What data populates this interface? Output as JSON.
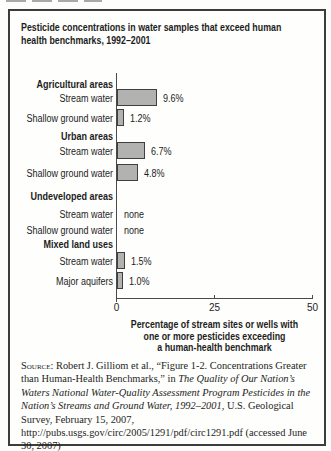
{
  "figure": {
    "title_lines": [
      "Pesticide concentrations in water samples that exceed human",
      "health benchmarks, 1992–2001"
    ]
  },
  "chart_data": {
    "type": "bar",
    "orientation": "horizontal",
    "title": "Pesticide concentrations in water samples that exceed human health benchmarks, 1992–2001",
    "xlabel": "Percentage of stream sites or wells with one or more pesticides exceeding a human-health benchmark",
    "xlabel_lines": [
      "Percentage of stream sites or wells with",
      "one or more pesticides exceeding",
      "a human-health benchmark"
    ],
    "xlim": [
      0,
      50
    ],
    "xticks": [
      "0",
      "25",
      "50"
    ],
    "grid": false,
    "bar_color": "#b2b2b0",
    "bar_border_color": "#3f3f3f",
    "groups": [
      {
        "header": "Agricultural areas",
        "items": [
          {
            "label": "Stream water",
            "value": 9.6,
            "display": "9.6%"
          },
          {
            "label": "Shallow ground water",
            "value": 1.2,
            "display": "1.2%"
          }
        ]
      },
      {
        "header": "Urban areas",
        "items": [
          {
            "label": "Stream water",
            "value": 6.7,
            "display": "6.7%"
          },
          {
            "label": "Shallow ground water",
            "value": 4.8,
            "display": "4.8%"
          }
        ]
      },
      {
        "header": "Undeveloped areas",
        "items": [
          {
            "label": "Stream water",
            "value": null,
            "display": "none"
          },
          {
            "label": "Shallow ground water",
            "value": null,
            "display": "none"
          }
        ]
      },
      {
        "header": "Mixed land uses",
        "items": [
          {
            "label": "Stream water",
            "value": 1.5,
            "display": "1.5%"
          },
          {
            "label": "Major aquifers",
            "value": 1.0,
            "display": "1.0%"
          }
        ]
      }
    ]
  },
  "source": {
    "segments": [
      {
        "text": "Source:",
        "style": "smallcaps"
      },
      {
        "text": " Robert J. Gilliom et al., “Figure 1-2. Concentrations Greater than Human-Health Benchmarks,” in ",
        "style": "normal"
      },
      {
        "text": "The Quality of Our Nation’s Waters National Water-Quality Assessment Program Pesticides in the Nation’s Streams and Ground Water, 1992–2001",
        "style": "italic"
      },
      {
        "text": ", U.S. Geological Survey, February 15, 2007, http://pubs.usgs.gov/circ/2005/1291/pdf/circ1291.pdf (accessed June 30, 2007)",
        "style": "normal"
      }
    ]
  }
}
